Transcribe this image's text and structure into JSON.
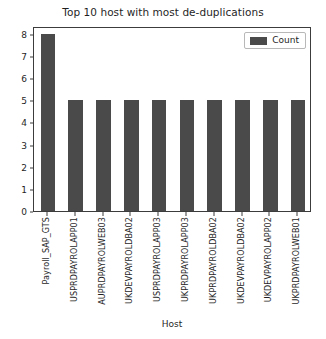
{
  "chart_data": {
    "type": "bar",
    "title": "Top 10 host with most de-duplications",
    "xlabel": "Host",
    "ylabel": "",
    "categories": [
      "Payroll_SAP_GTS",
      "USPRDPAYROLAPP01",
      "AUPRDPAYROLWEB03",
      "UKDEVPAYROLDBA02",
      "USPRDPAYROLAPP03",
      "UKPRDPAYROLAPP03",
      "UKPRDPAYROLDBA02",
      "UKDEVPAYROLDBA02",
      "UKDEVPAYROLAPP02",
      "UKPRDPAYROLWEB01"
    ],
    "values": [
      8,
      5,
      5,
      5,
      5,
      5,
      5,
      5,
      5,
      5
    ],
    "series": [
      {
        "name": "Count",
        "values": [
          8,
          5,
          5,
          5,
          5,
          5,
          5,
          5,
          5,
          5
        ]
      }
    ],
    "ylim": [
      0,
      8.35
    ],
    "y_ticks": [
      0,
      1,
      2,
      3,
      4,
      5,
      6,
      7,
      8
    ],
    "y_tick_labels": [
      "0",
      "1",
      "2",
      "3",
      "4",
      "5",
      "6",
      "7",
      "8"
    ],
    "grid": false,
    "legend": {
      "position": "upper right",
      "entries": [
        {
          "label": "Count",
          "color": "#4a4a4a"
        }
      ]
    },
    "bar_color": "#4a4a4a",
    "background_color": "#ffffff",
    "axis_color": "#3c3c3c"
  }
}
